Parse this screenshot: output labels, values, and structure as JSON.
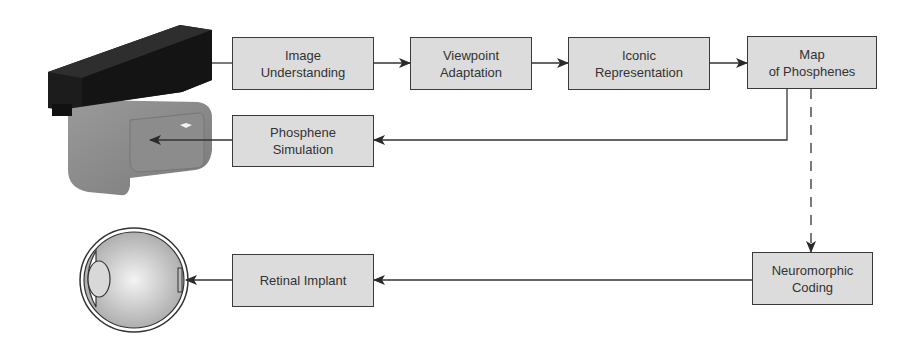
{
  "diagram": {
    "nodes": {
      "image_understanding": "Image\nUnderstanding",
      "viewpoint_adaptation": "Viewpoint\nAdaptation",
      "iconic_representation": "Iconic\nRepresentation",
      "map_of_phosphenes": "Map\nof Phosphenes",
      "phosphene_simulation": "Phosphene\nSimulation",
      "neuromorphic_coding": "Neuromorphic\nCoding",
      "retinal_implant": "Retinal Implant"
    },
    "images": {
      "headset": "camera-headset-device",
      "eye": "eye-cross-section"
    },
    "edges": [
      {
        "from": "headset",
        "to": "image_understanding",
        "style": "solid"
      },
      {
        "from": "image_understanding",
        "to": "viewpoint_adaptation",
        "style": "solid"
      },
      {
        "from": "viewpoint_adaptation",
        "to": "iconic_representation",
        "style": "solid"
      },
      {
        "from": "iconic_representation",
        "to": "map_of_phosphenes",
        "style": "solid"
      },
      {
        "from": "map_of_phosphenes",
        "to": "phosphene_simulation",
        "style": "solid"
      },
      {
        "from": "phosphene_simulation",
        "to": "headset",
        "style": "solid"
      },
      {
        "from": "map_of_phosphenes",
        "to": "neuromorphic_coding",
        "style": "dashed"
      },
      {
        "from": "neuromorphic_coding",
        "to": "retinal_implant",
        "style": "solid"
      },
      {
        "from": "retinal_implant",
        "to": "eye",
        "style": "solid"
      }
    ]
  }
}
